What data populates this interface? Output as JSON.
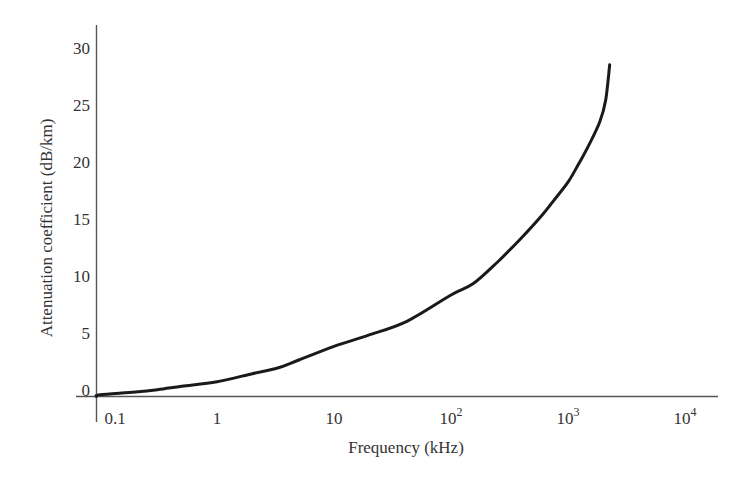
{
  "chart_data": {
    "type": "line",
    "title": "",
    "xlabel": "Frequency (kHz)",
    "ylabel": "Attenuation coefficient (dB/km)",
    "x_scale": "log",
    "xlim": [
      0.1,
      10000
    ],
    "ylim": [
      0,
      30
    ],
    "grid": false,
    "legend": null,
    "x_ticks": [
      {
        "value": 0.1,
        "label": "0.1",
        "base": "0.1",
        "exp": ""
      },
      {
        "value": 1,
        "label": "1",
        "base": "1",
        "exp": ""
      },
      {
        "value": 10,
        "label": "10",
        "base": "10",
        "exp": ""
      },
      {
        "value": 100,
        "label": "10^2",
        "base": "10",
        "exp": "2"
      },
      {
        "value": 1000,
        "label": "10^3",
        "base": "10",
        "exp": "3"
      },
      {
        "value": 10000,
        "label": "10^4",
        "base": "10",
        "exp": "4"
      }
    ],
    "y_ticks": [
      0,
      5,
      10,
      15,
      20,
      25,
      30
    ],
    "series": [
      {
        "name": "Attenuation coefficient",
        "color": "#1a1a1a",
        "x": [
          0.085,
          0.1,
          0.2,
          0.31,
          0.5,
          1,
          2,
          3.3,
          5,
          10,
          20,
          42,
          100,
          155,
          250,
          390,
          600,
          743,
          1000,
          1263,
          1500,
          1870,
          2100,
          2270
        ],
        "y": [
          0.0,
          0.15,
          0.4,
          0.6,
          0.9,
          1.3,
          2.0,
          2.5,
          3.2,
          4.4,
          5.4,
          6.6,
          8.9,
          9.9,
          11.8,
          13.8,
          15.9,
          17.1,
          18.8,
          20.6,
          22.0,
          24.1,
          26.0,
          29.1
        ]
      }
    ]
  }
}
